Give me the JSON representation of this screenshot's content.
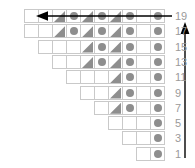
{
  "figure": {
    "colors": {
      "glyph_gray": "#8e8e8e",
      "cell_border": "#c9c9c9",
      "label_gray": "#9a9a9a",
      "arrow_black": "#000000",
      "background": "#ffffff"
    },
    "legend": {
      "circle_name": "circle-marker",
      "triangle_name": "triangle-marker",
      "empty_name": "empty-cell"
    }
  },
  "chart_data": {
    "type": "heatmap",
    "xlabel": "",
    "ylabel": "",
    "grid": true,
    "legend_position": "none",
    "row_labels": [
      19,
      17,
      15,
      13,
      11,
      9,
      7,
      5,
      3,
      1
    ],
    "cell_symbols": {
      "0": "empty",
      "1": "circle",
      "2": "triangle"
    },
    "rows": [
      {
        "label": 19,
        "cells": [
          "empty",
          "empty",
          "triangle",
          "circle",
          "triangle",
          "circle",
          "triangle",
          "circle",
          "empty",
          "circle"
        ]
      },
      {
        "label": 17,
        "cells": [
          "empty",
          "empty",
          "triangle",
          "circle",
          "triangle",
          "circle",
          "triangle",
          "circle",
          "empty",
          "circle"
        ]
      },
      {
        "label": 15,
        "cells": [
          "empty",
          "empty",
          "empty",
          "triangle",
          "circle",
          "triangle",
          "circle",
          "empty",
          "circle"
        ]
      },
      {
        "label": 13,
        "cells": [
          "empty",
          "empty",
          "triangle",
          "circle",
          "triangle",
          "circle",
          "empty",
          "circle"
        ]
      },
      {
        "label": 11,
        "cells": [
          "empty",
          "empty",
          "empty",
          "triangle",
          "circle",
          "empty",
          "circle"
        ]
      },
      {
        "label": 9,
        "cells": [
          "empty",
          "empty",
          "triangle",
          "circle",
          "empty",
          "circle"
        ]
      },
      {
        "label": 7,
        "cells": [
          "empty",
          "triangle",
          "circle",
          "empty",
          "circle"
        ]
      },
      {
        "label": 5,
        "cells": [
          "empty",
          "empty",
          "empty",
          "circle"
        ]
      },
      {
        "label": 3,
        "cells": [
          "empty",
          "empty",
          "circle"
        ]
      },
      {
        "label": 1,
        "cells": [
          "empty",
          "circle"
        ]
      }
    ]
  },
  "annotations": {
    "horizontal_arrow": {
      "name": "leftward-arrow",
      "direction": "left",
      "row_label": 19
    },
    "vertical_arrow": {
      "name": "upward-arrow",
      "direction": "up"
    }
  }
}
